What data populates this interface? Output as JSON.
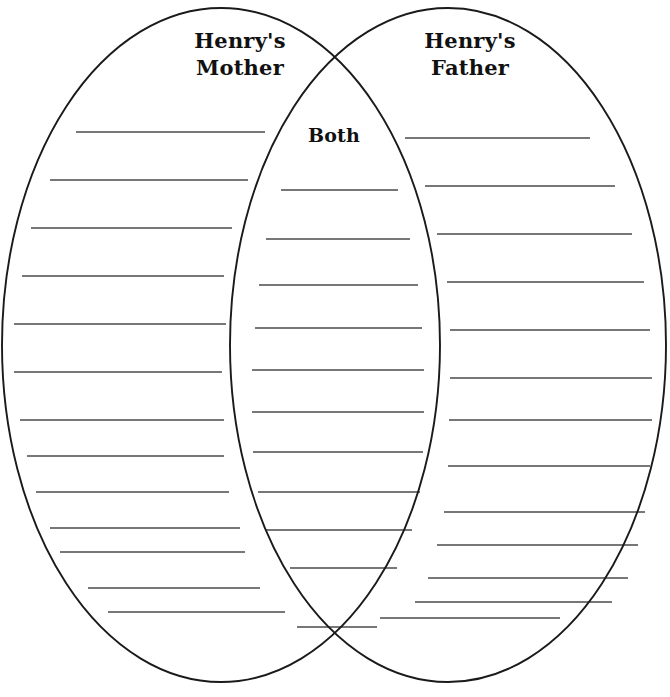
{
  "page": {
    "kind": "venn-diagram-worksheet",
    "background_color": "#ffffff",
    "width": 670,
    "height": 697
  },
  "labels": {
    "left": "Henry's\nMother",
    "right": "Henry's\nFather",
    "center": "Both"
  },
  "style": {
    "outline_color": "#1a1a1a",
    "outline_width": 1.9,
    "rule_color": "#4a4a4a",
    "rule_width": 1.7,
    "text_color": "#111111"
  },
  "diagram": {
    "type": "venn",
    "set_count": 2,
    "ellipses": [
      {
        "name": "left-ellipse",
        "cx": 221,
        "cy": 345,
        "rx": 219,
        "ry": 337
      },
      {
        "name": "right-ellipse",
        "cx": 448,
        "cy": 345,
        "rx": 218,
        "ry": 337
      }
    ],
    "intersections": [
      {
        "x": 335,
        "y": 67
      },
      {
        "x": 333,
        "y": 627
      }
    ]
  },
  "regions": {
    "left": {
      "name": "Henry's Mother",
      "line_count": 13,
      "lines": [
        {
          "y": 132,
          "x1": 76,
          "x2": 265
        },
        {
          "y": 180,
          "x1": 50,
          "x2": 248
        },
        {
          "y": 228,
          "x1": 31,
          "x2": 232
        },
        {
          "y": 276,
          "x1": 22,
          "x2": 224
        },
        {
          "y": 324,
          "x1": 14,
          "x2": 226
        },
        {
          "y": 372,
          "x1": 14,
          "x2": 222
        },
        {
          "y": 420,
          "x1": 20,
          "x2": 224
        },
        {
          "y": 456,
          "x1": 27,
          "x2": 224
        },
        {
          "y": 492,
          "x1": 36,
          "x2": 229
        },
        {
          "y": 528,
          "x1": 50,
          "x2": 240
        },
        {
          "y": 552,
          "x1": 60,
          "x2": 245
        },
        {
          "y": 588,
          "x1": 88,
          "x2": 260
        },
        {
          "y": 612,
          "x1": 108,
          "x2": 285
        }
      ]
    },
    "center": {
      "name": "Both",
      "line_count": 11,
      "lines": [
        {
          "y": 190,
          "x1": 281,
          "x2": 398
        },
        {
          "y": 239,
          "x1": 266,
          "x2": 410
        },
        {
          "y": 285,
          "x1": 259,
          "x2": 418
        },
        {
          "y": 328,
          "x1": 255,
          "x2": 422
        },
        {
          "y": 370,
          "x1": 252,
          "x2": 424
        },
        {
          "y": 412,
          "x1": 252,
          "x2": 424
        },
        {
          "y": 452,
          "x1": 253,
          "x2": 423
        },
        {
          "y": 492,
          "x1": 258,
          "x2": 420
        },
        {
          "y": 530,
          "x1": 266,
          "x2": 412
        },
        {
          "y": 568,
          "x1": 290,
          "x2": 397
        },
        {
          "y": 627,
          "x1": 297,
          "x2": 377
        }
      ]
    },
    "right": {
      "name": "Henry's Father",
      "line_count": 13,
      "lines": [
        {
          "y": 138,
          "x1": 405,
          "x2": 590
        },
        {
          "y": 186,
          "x1": 425,
          "x2": 615
        },
        {
          "y": 234,
          "x1": 437,
          "x2": 632
        },
        {
          "y": 282,
          "x1": 447,
          "x2": 644
        },
        {
          "y": 330,
          "x1": 450,
          "x2": 650
        },
        {
          "y": 378,
          "x1": 450,
          "x2": 652
        },
        {
          "y": 420,
          "x1": 449,
          "x2": 652
        },
        {
          "y": 466,
          "x1": 448,
          "x2": 650
        },
        {
          "y": 512,
          "x1": 444,
          "x2": 645
        },
        {
          "y": 545,
          "x1": 437,
          "x2": 638
        },
        {
          "y": 578,
          "x1": 428,
          "x2": 628
        },
        {
          "y": 602,
          "x1": 415,
          "x2": 612
        },
        {
          "y": 618,
          "x1": 380,
          "x2": 560
        }
      ]
    }
  }
}
